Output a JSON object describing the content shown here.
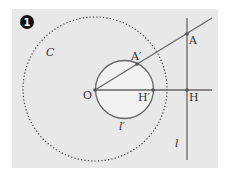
{
  "figure": {
    "number_badge": "1",
    "colors": {
      "panel": "#e8e8e8",
      "line": "#666666",
      "dot": "#555555",
      "text": "#333333",
      "inner_fill": "#f2f2f2"
    },
    "labels": {
      "C": "C",
      "A": "A",
      "A_prime": "A′",
      "O": "O",
      "H_prime": "H′",
      "H": "H",
      "l_prime": "l′",
      "l": "l"
    }
  }
}
